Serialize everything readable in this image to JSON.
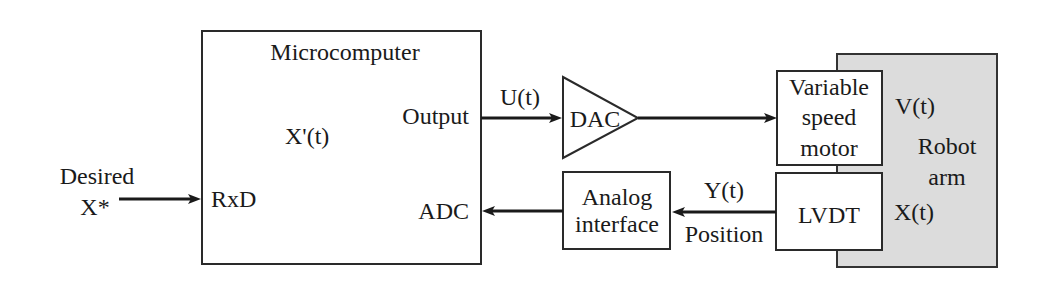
{
  "diagram": {
    "colors": {
      "line": "#1a1a1a",
      "box_fill": "#ffffff",
      "robot_fill": "#dcdcdc"
    },
    "input": {
      "label_line1": "Desired",
      "label_line2": "X*"
    },
    "microcomputer": {
      "title": "Microcomputer",
      "internal_signal": "X'(t)",
      "port_in": "RxD",
      "port_out": "Output",
      "port_adc": "ADC"
    },
    "signals": {
      "control": "U(t)",
      "feedback": "Y(t)",
      "feedback_caption": "Position"
    },
    "dac": {
      "label": "DAC"
    },
    "motor": {
      "line1": "Variable",
      "line2": "speed",
      "line3": "motor"
    },
    "lvdt": {
      "label": "LVDT"
    },
    "analog_interface": {
      "line1": "Analog",
      "line2": "interface"
    },
    "robot": {
      "line1": "Robot",
      "line2": "arm",
      "velocity": "V(t)",
      "position": "X(t)"
    }
  }
}
